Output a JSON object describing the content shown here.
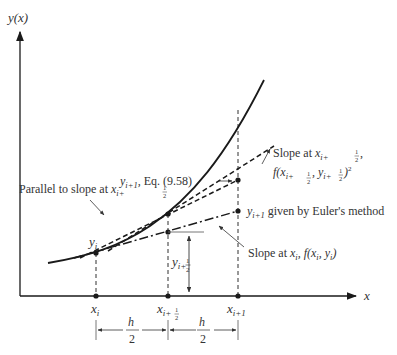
{
  "figure": {
    "axes": {
      "y_label": "y(x)",
      "x_label": "x"
    },
    "x_ticks": [
      {
        "label": "x",
        "sub": "i"
      },
      {
        "label": "x",
        "sub": "i+",
        "frac": "1/2"
      },
      {
        "label": "x",
        "sub": "i+1"
      }
    ],
    "spacing": {
      "h_half_num": "h",
      "h_half_den": "2"
    },
    "points": {
      "yi": {
        "label": "y",
        "sub": "i"
      }
    },
    "annotations": {
      "eq_point": {
        "pre": "y",
        "sub": "i+1",
        "text": ", Eq. (9.58)"
      },
      "slope_mid_line1": {
        "text": "Slope at ",
        "var": "x",
        "sub": "i+",
        "frac_num": "1",
        "frac_den": "2",
        "tail": ","
      },
      "slope_mid_line2": {
        "text": "f(x",
        "sub1": "i+",
        "frac": "1/2",
        "mid": ", y",
        "sub2": "i+",
        "tail": ")"
      },
      "euler_point": {
        "pre": "y",
        "sub": "i+1",
        "text": " given by Euler's method"
      },
      "parallel": {
        "text": "Parallel to slope at ",
        "var": "x",
        "sub": "i+"
      },
      "slope_i": {
        "text": "Slope at ",
        "var": "x",
        "sub": "i",
        "tail": ", f(x",
        "tail_sub": "i",
        "mid": ", y",
        "end": ")"
      },
      "y_half": {
        "label": "y",
        "sub": "i+"
      }
    },
    "colors": {
      "line": "#1a1a1a",
      "text": "#333333",
      "background": "#ffffff"
    }
  }
}
